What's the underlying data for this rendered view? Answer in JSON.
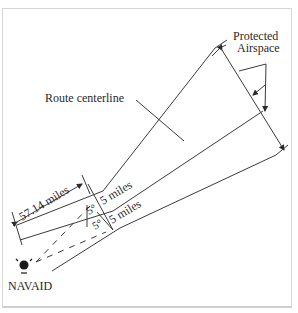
{
  "diagram": {
    "labels": {
      "protected_line1": "Protected",
      "protected_line2": "Airspace",
      "route_centerline": "Route centerline",
      "distance": "57.14 miles",
      "upper_width": "5 miles",
      "lower_width": "5 miles",
      "upper_angle": "5°",
      "lower_angle": "5°",
      "navaid": "NAVAID"
    },
    "colors": {
      "line": "#3a3a3a",
      "text": "#2a2a2a",
      "frame": "#d6d6d6"
    }
  }
}
